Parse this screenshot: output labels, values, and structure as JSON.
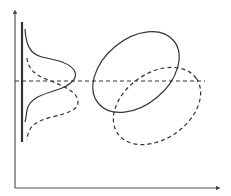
{
  "diagram": {
    "type": "distribution-shift-illustration",
    "colors": {
      "background": "#ffffff",
      "stroke": "#333333",
      "axis": "#444444"
    },
    "axes": {
      "y_axis": {
        "x": 15,
        "y_top": 12,
        "y_bottom": 188,
        "arrow": true
      },
      "x_axis": {
        "y": 188,
        "x_left": 15,
        "x_right": 218,
        "arrow": true
      }
    },
    "marginal_baseline": {
      "x": 22,
      "y_top": 22,
      "y_bottom": 142,
      "style": "solid-thick"
    },
    "reference_line": {
      "y": 81,
      "x_start": 15,
      "x_end": 205,
      "style": "dashed"
    },
    "marginal_curves": [
      {
        "name": "solid-density",
        "style": "solid"
      },
      {
        "name": "dashed-density",
        "style": "dashed"
      }
    ],
    "ellipses": [
      {
        "name": "solid-ellipse",
        "cx": 136,
        "cy": 72,
        "rx": 49,
        "ry": 33,
        "rotation": -40,
        "style": "solid"
      },
      {
        "name": "dashed-ellipse",
        "cx": 157,
        "cy": 106,
        "rx": 48,
        "ry": 33,
        "rotation": -35,
        "style": "dashed"
      }
    ]
  }
}
